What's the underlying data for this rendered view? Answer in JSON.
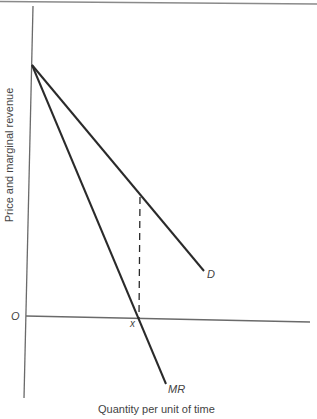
{
  "diagram": {
    "title": "",
    "type": "economics-demand-marginal-revenue",
    "axes": {
      "x_label": "Quantity per unit of time",
      "y_label": "Price and marginal revenue",
      "origin_label": "O"
    },
    "curves": [
      {
        "name": "D",
        "label": "D",
        "description": "Demand curve, downward sloping from price-axis intercept"
      },
      {
        "name": "MR",
        "label": "MR",
        "description": "Marginal revenue curve, twice as steep as demand, crossing quantity axis at x"
      }
    ],
    "markers": {
      "x_intercept_label": "x",
      "dashed_line": "Vertical dashed line from MR x-intercept up to demand curve"
    },
    "colors": {
      "line": "#2a2a2a",
      "axis": "#6a6a6a",
      "text": "#444444",
      "background": "#ffffff"
    }
  }
}
